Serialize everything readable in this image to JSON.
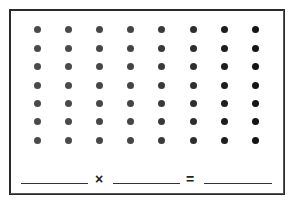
{
  "worksheet": {
    "array": {
      "rows": 7,
      "columns": 8,
      "dot_colors": [
        "#4a4a4a",
        "#4a4a4a",
        "#474747",
        "#454545",
        "#3a3a3a",
        "#2e2e2e",
        "#1e1e1e",
        "#151515"
      ]
    },
    "equation": {
      "factor_1": "",
      "times_symbol": "×",
      "factor_2": "",
      "equals_symbol": "=",
      "product": ""
    }
  }
}
